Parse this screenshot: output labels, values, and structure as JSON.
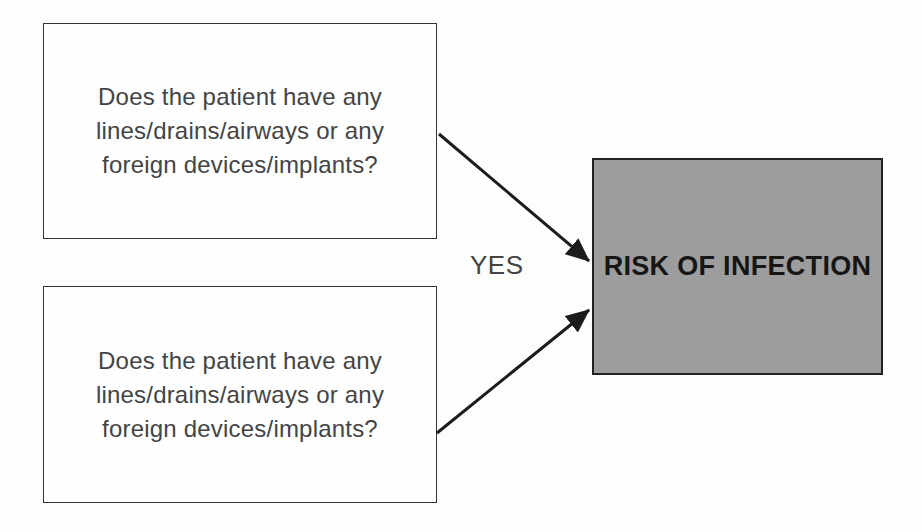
{
  "diagram": {
    "question_top": {
      "lines": [
        "Does the patient have any",
        "lines/drains/airways or any",
        "foreign devices/implants?"
      ]
    },
    "question_bottom": {
      "lines": [
        "Does the patient have any",
        "lines/drains/airways or any",
        "foreign devices/implants?"
      ]
    },
    "edge_label": "YES",
    "outcome": {
      "label": "RISK OF INFECTION"
    },
    "colors": {
      "background": "#fdfdfc",
      "box_border": "#333333",
      "question_text": "#444444",
      "outcome_fill": "#9d9d9d",
      "outcome_border": "#222222",
      "outcome_text": "#161616",
      "arrow_color": "#1c1c1c"
    }
  }
}
